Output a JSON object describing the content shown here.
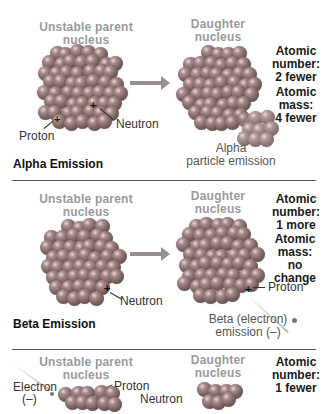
{
  "sections": [
    {
      "title": "Alpha Emission",
      "parent_label": [
        "Unstable parent",
        "nucleus"
      ],
      "daughter_label": [
        "Daughter",
        "nucleus"
      ],
      "facts": [
        {
          "heading": "Atomic",
          "line2": "number:",
          "line3": "2 fewer"
        },
        {
          "heading": "Atomic",
          "line2": "mass:",
          "line3": "4 fewer"
        }
      ],
      "labels": {
        "proton": "Proton",
        "neutron": "Neutron"
      },
      "emission_label": [
        "Alpha",
        "particle emission"
      ]
    },
    {
      "title": "Beta Emission",
      "parent_label": [
        "Unstable parent",
        "nucleus"
      ],
      "daughter_label": [
        "Daughter",
        "nucleus"
      ],
      "facts": [
        {
          "heading": "Atomic",
          "line2": "number:",
          "line3": "1 more"
        },
        {
          "heading": "Atomic",
          "line2": "mass:",
          "line3": "no change"
        }
      ],
      "labels": {
        "neutron": "Neutron",
        "proton": "Proton"
      },
      "emission_label": [
        "Beta (electron)",
        "emission (–)"
      ]
    },
    {
      "parent_label": [
        "Unstable parent",
        "nucleus"
      ],
      "daughter_label": [
        "Daughter",
        "nucleus"
      ],
      "facts": [
        {
          "heading": "Atomic",
          "line2": "number:",
          "line3": "1 fewer"
        }
      ],
      "labels": {
        "electron": "Electron",
        "electron_sign": "(–)",
        "proton": "Proton",
        "neutron": "Neutron"
      }
    }
  ],
  "colors": {
    "title_gray": "#9a9a9a",
    "rule": "#555555",
    "sphere": "#7a6262"
  }
}
